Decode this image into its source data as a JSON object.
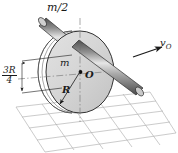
{
  "figure": {
    "labels": {
      "rod_mass": "m/2",
      "disc_mass": "m",
      "center_point": "O",
      "radius": "R",
      "velocity": "v",
      "velocity_subscript": "O",
      "offset_numerator": "3R",
      "offset_denominator": "4"
    },
    "colors": {
      "disc_fill": "#d6d6d6",
      "disc_edge": "#3a3a3a",
      "disc_rim_fill": "#efefef",
      "rod_dark": "#5a5a5a",
      "rod_light": "#e8e8e8",
      "rod_edge": "#2b2b2b",
      "grid_line": "#9a9a9a",
      "center_line": "#707070",
      "text": "#1a1a1a",
      "background": "#ffffff"
    },
    "geometry": {
      "disc_center_x": 80,
      "disc_center_y": 72,
      "disc_radius_x": 34,
      "disc_radius_y": 41,
      "offset_from_center": "3R/4"
    }
  }
}
